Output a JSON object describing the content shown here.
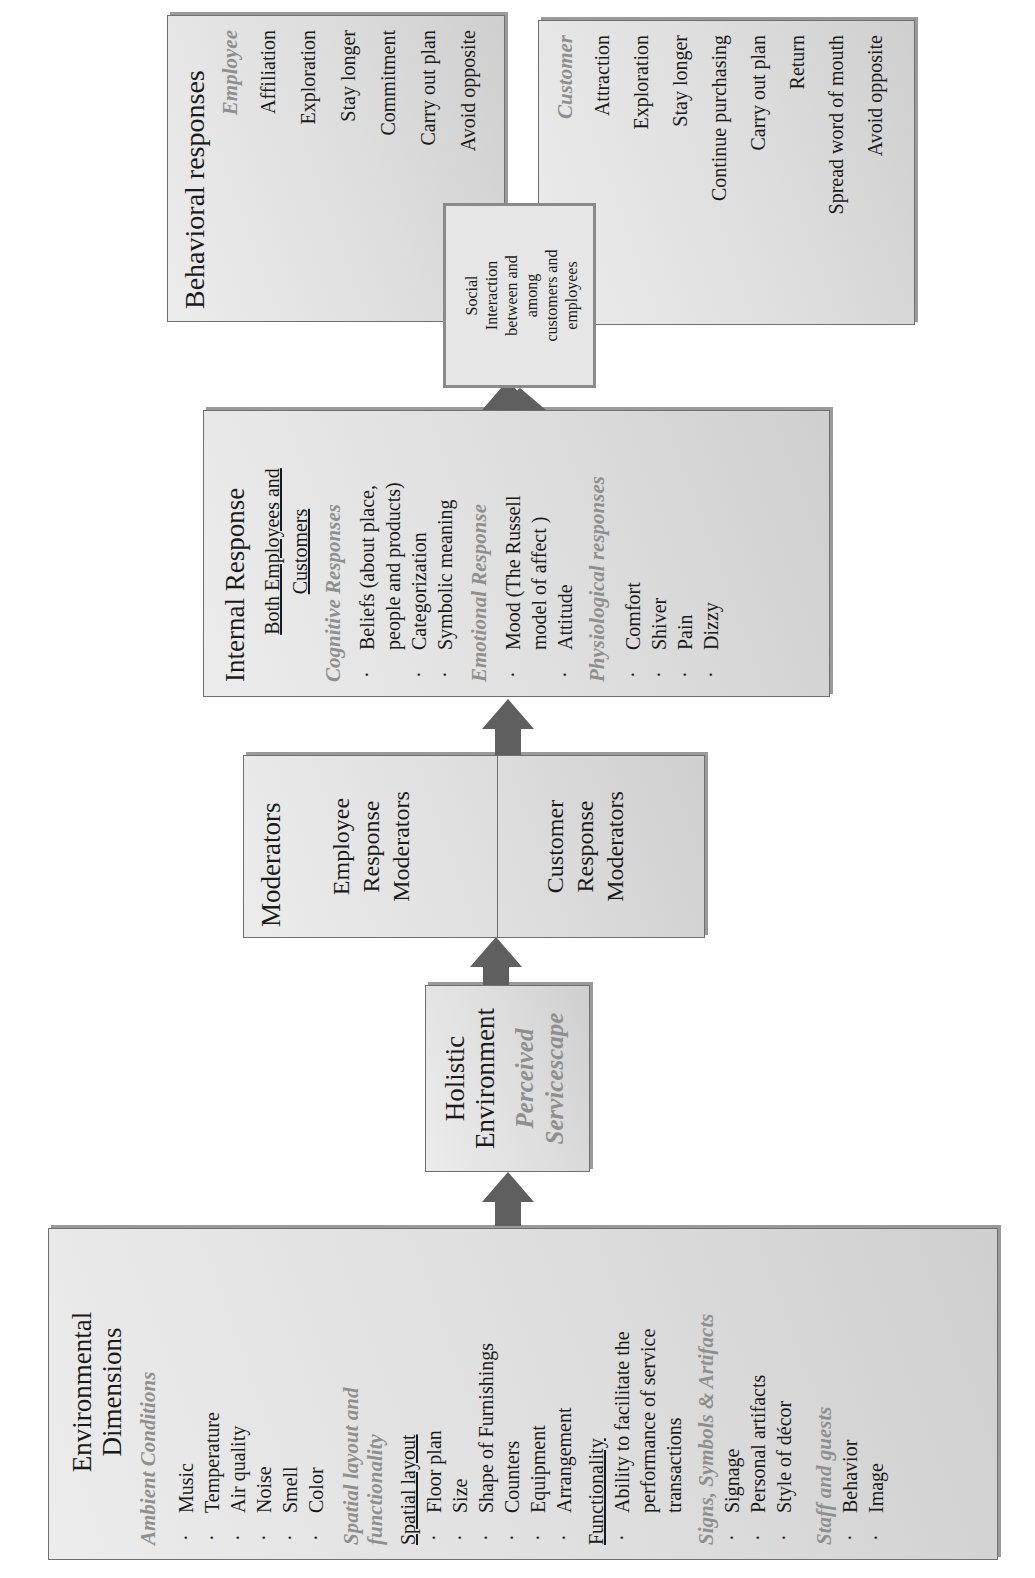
{
  "environmental": {
    "title_line1": "Environmental",
    "title_line2": "Dimensions",
    "ambient": {
      "heading": "Ambient Conditions",
      "items": [
        "Music",
        "Temperature",
        "Air quality",
        "Noise",
        "Smell",
        "Color"
      ]
    },
    "spatial": {
      "heading_line1": "Spatial layout and",
      "heading_line2": "functionality",
      "spatial_layout_label": "Spatial layout",
      "spatial_items": [
        "Floor plan",
        "Size",
        "Shape of Furnishings",
        "Counters",
        "Equipment",
        "Arrangement"
      ],
      "functionality_label": "Functionality",
      "functionality_items": [
        "Ability to facilitate the",
        "performance of service",
        "transactions"
      ]
    },
    "signs": {
      "heading": "Signs, Symbols & Artifacts",
      "items": [
        "Signage",
        "Personal artifacts",
        "Style of décor"
      ]
    },
    "staff": {
      "heading": "Staff and guests",
      "items": [
        "Behavior",
        "Image"
      ]
    }
  },
  "holistic": {
    "title_line1": "Holistic",
    "title_line2": "Environment",
    "sub_line1": "Perceived",
    "sub_line2": "Servicescape"
  },
  "moderators": {
    "title": "Moderators",
    "employee": [
      "Employee",
      "Response",
      "Moderators"
    ],
    "customer": [
      "Customer",
      "Response",
      "Moderators"
    ]
  },
  "internal": {
    "title": "Internal Response",
    "audience_line1": "Both Employees and",
    "audience_line2": "Customers",
    "cognitive": {
      "heading": "Cognitive Responses",
      "items": [
        {
          "lines": [
            "Beliefs (about place,",
            "people and products)"
          ]
        },
        {
          "lines": [
            "Categorization"
          ]
        },
        {
          "lines": [
            "Symbolic meaning"
          ]
        }
      ]
    },
    "emotional": {
      "heading": "Emotional Response",
      "items": [
        {
          "lines": [
            "Mood (The Russell",
            "model of affect )"
          ]
        },
        {
          "lines": [
            "Attitude"
          ]
        }
      ]
    },
    "physiological": {
      "heading": "Physiological responses",
      "items": [
        "Comfort",
        "Shiver",
        "Pain",
        "Dizzy"
      ]
    }
  },
  "social": {
    "lines": [
      "Social",
      "Interaction",
      "between and",
      "among",
      "customers and",
      "employees"
    ]
  },
  "behavioral": {
    "title": "Behavioral responses",
    "employee": {
      "heading": "Employee",
      "items": [
        "Affiliation",
        "Exploration",
        "Stay longer",
        "Commitment",
        "Carry out plan",
        "Avoid opposite"
      ]
    },
    "customer": {
      "heading": "Customer",
      "items": [
        "Attraction",
        "Exploration",
        "Stay longer",
        "Continue purchasing",
        "Carry out plan",
        "Return",
        "Spread word of mouth",
        "Avoid opposite"
      ]
    }
  },
  "colors": {
    "box_fill": "#dedede",
    "arrow": "#5f5f5f",
    "italic_heading": "#8f8f8f",
    "border": "#6f6f6f"
  }
}
